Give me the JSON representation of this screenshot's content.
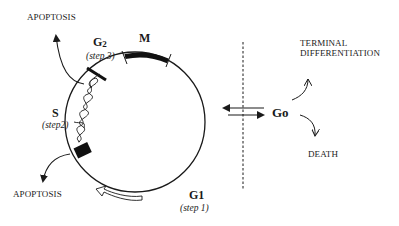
{
  "diagram": {
    "type": "cell-cycle",
    "colors": {
      "ink": "#1a1a1a",
      "background": "#ffffff"
    },
    "phases": [
      {
        "id": "M",
        "label": "M"
      },
      {
        "id": "G2",
        "label": "G2",
        "sub": "2",
        "step": "(step 3)"
      },
      {
        "id": "S",
        "label": "S",
        "step": "(step2)"
      },
      {
        "id": "G1",
        "label": "G1",
        "sub": "1",
        "step": "(step 1)"
      }
    ],
    "outcomes": {
      "apoptosis_top": "APOPTOSIS",
      "apoptosis_bottom": "APOPTOSIS",
      "terminal_1": "TERMINAL",
      "terminal_2": "DIFFERENTIATION",
      "death": "DEATH"
    },
    "quiescent": {
      "label": "Go"
    },
    "icons": [
      "curved-arrow-icon",
      "double-arrow-icon",
      "hollow-arrow-icon",
      "dna-helix-icon",
      "checkpoint-block-icon"
    ]
  }
}
